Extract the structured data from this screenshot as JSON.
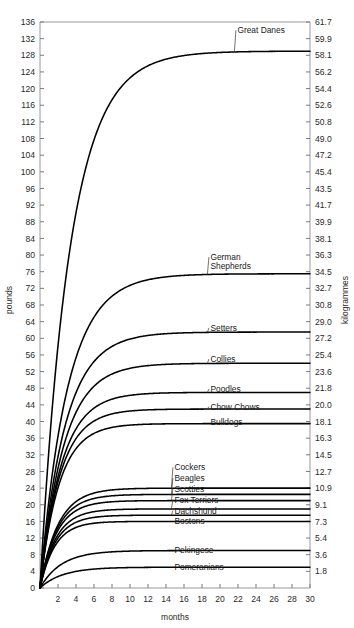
{
  "chart_data": {
    "type": "line",
    "title": "",
    "xlabel": "months",
    "ylabel": "pounds",
    "ylabel_right": "kilogrammes",
    "xlim": [
      0,
      30
    ],
    "ylim": [
      0,
      136
    ],
    "grid": false,
    "legend_position": "inline-right-of-curve",
    "x_ticks": [
      0,
      2,
      4,
      6,
      8,
      10,
      12,
      14,
      16,
      18,
      20,
      22,
      24,
      26,
      28,
      30
    ],
    "y_ticks_left": [
      0,
      4,
      8,
      12,
      16,
      20,
      24,
      28,
      32,
      36,
      40,
      44,
      48,
      52,
      56,
      60,
      64,
      68,
      72,
      76,
      80,
      84,
      88,
      92,
      96,
      100,
      104,
      108,
      112,
      116,
      120,
      124,
      128,
      132,
      136
    ],
    "y_ticks_right": [
      "1.8",
      "3.6",
      "5.4",
      "7.3",
      "9.1",
      "10.9",
      "12.7",
      "14.5",
      "16.3",
      "18.1",
      "20.0",
      "21.8",
      "23.6",
      "25.4",
      "27.2",
      "29.0",
      "30.8",
      "32.7",
      "34.5",
      "36.3",
      "38.1",
      "39.9",
      "41.7",
      "43.5",
      "45.4",
      "47.2",
      "49.0",
      "50.8",
      "52.6",
      "54.4",
      "56.2",
      "58.1",
      "59.9",
      "61.7"
    ],
    "series": [
      {
        "name": "Great Danes",
        "plateau_lbs": 129,
        "rate": 0.3,
        "label_x": 21.6,
        "label_y_lbs": 134.0
      },
      {
        "name": "German Shepherds",
        "plateau_lbs": 75.5,
        "rate": 0.33,
        "label_x": 18.6,
        "label_y_lbs": 79.5,
        "label_lines": [
          "German",
          "Shepherds"
        ]
      },
      {
        "name": "Setters",
        "plateau_lbs": 61.5,
        "rate": 0.36,
        "label_x": 18.6,
        "label_y_lbs": 62.5
      },
      {
        "name": "Collies",
        "plateau_lbs": 54.0,
        "rate": 0.38,
        "label_x": 18.6,
        "label_y_lbs": 55.0
      },
      {
        "name": "Poodles",
        "plateau_lbs": 47.0,
        "rate": 0.42,
        "label_x": 18.6,
        "label_y_lbs": 47.8
      },
      {
        "name": "Chow Chows",
        "plateau_lbs": 43.0,
        "rate": 0.45,
        "label_x": 18.6,
        "label_y_lbs": 43.6
      },
      {
        "name": "Bulldogs",
        "plateau_lbs": 39.5,
        "rate": 0.47,
        "label_x": 18.6,
        "label_y_lbs": 39.8
      },
      {
        "name": "Cockers",
        "plateau_lbs": 24.0,
        "rate": 0.5,
        "label_x": 14.6,
        "label_y_lbs": 29.0
      },
      {
        "name": "Beagles",
        "plateau_lbs": 22.5,
        "rate": 0.52,
        "label_x": 14.6,
        "label_y_lbs": 26.4
      },
      {
        "name": "Scotties",
        "plateau_lbs": 21.0,
        "rate": 0.54,
        "label_x": 14.6,
        "label_y_lbs": 23.8
      },
      {
        "name": "Fox Terriers",
        "plateau_lbs": 19.0,
        "rate": 0.56,
        "label_x": 14.6,
        "label_y_lbs": 21.2
      },
      {
        "name": "Dachshund",
        "plateau_lbs": 17.5,
        "rate": 0.58,
        "label_x": 14.6,
        "label_y_lbs": 18.6
      },
      {
        "name": "Bostons",
        "plateau_lbs": 16.0,
        "rate": 0.6,
        "label_x": 14.6,
        "label_y_lbs": 16.0
      },
      {
        "name": "Pekingese",
        "plateau_lbs": 9.0,
        "rate": 0.42,
        "label_x": 14.6,
        "label_y_lbs": 9.2
      },
      {
        "name": "Pomeranians",
        "plateau_lbs": 5.0,
        "rate": 0.4,
        "label_x": 14.6,
        "label_y_lbs": 5.0
      }
    ]
  },
  "colors": {
    "curve": "#000000",
    "axis": "#9a9a9a",
    "text": "#1a1a1a",
    "background": "#ffffff"
  }
}
